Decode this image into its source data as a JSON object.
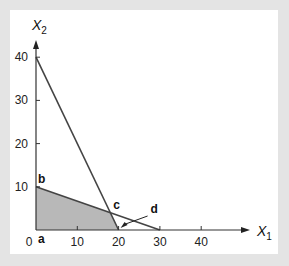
{
  "chart_data": {
    "type": "line",
    "title": "",
    "xlabel": "X1",
    "ylabel": "X2",
    "xlabel_base": "X",
    "xlabel_sub": "1",
    "ylabel_base": "X",
    "ylabel_sub": "2",
    "xlim": [
      0,
      50
    ],
    "ylim": [
      0,
      42
    ],
    "x_ticks": [
      0,
      10,
      20,
      30,
      40
    ],
    "y_ticks": [
      10,
      20,
      30,
      40
    ],
    "x_tick_labels": [
      "0",
      "10",
      "20",
      "30",
      "40"
    ],
    "y_tick_labels": [
      "10",
      "20",
      "30",
      "40"
    ],
    "grid": false,
    "series": [
      {
        "name": "constraint-1",
        "points": [
          [
            0,
            40
          ],
          [
            20,
            0
          ]
        ],
        "color": "#444444"
      },
      {
        "name": "constraint-2",
        "points": [
          [
            0,
            10
          ],
          [
            30,
            0
          ]
        ],
        "color": "#444444"
      }
    ],
    "feasible_region": {
      "vertices": [
        [
          0,
          0
        ],
        [
          0,
          10
        ],
        [
          18,
          4
        ],
        [
          20,
          0
        ]
      ],
      "fill": "#b8b8b8"
    },
    "annotations": [
      {
        "label": "a",
        "point": [
          0,
          0
        ]
      },
      {
        "label": "b",
        "point": [
          0,
          10
        ]
      },
      {
        "label": "c",
        "point": [
          18,
          4
        ]
      },
      {
        "label": "d",
        "point": [
          20,
          0
        ],
        "arrow": true
      }
    ]
  },
  "colors": {
    "background": "#e4e4e4",
    "panel": "#ffffff",
    "line": "#444444",
    "region": "#b8b8b8"
  }
}
